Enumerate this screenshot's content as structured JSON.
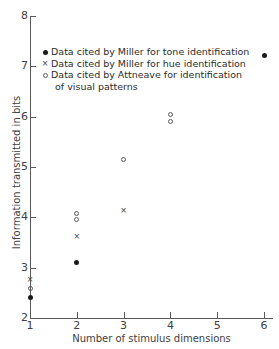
{
  "chart_data": {
    "type": "scatter",
    "title": "",
    "xlabel": "Number of stimulus dimensions",
    "ylabel": "Information transmitted in bits",
    "xlim": [
      1,
      6
    ],
    "ylim": [
      2,
      8
    ],
    "xticks": [
      1,
      2,
      3,
      4,
      5,
      6
    ],
    "yticks": [
      2,
      3,
      4,
      5,
      6,
      7,
      8
    ],
    "xtick_labels": [
      "1",
      "2",
      "3",
      "4",
      "5",
      "6"
    ],
    "ytick_labels": [
      "2",
      "3",
      "4",
      "5",
      "6",
      "7",
      "8"
    ],
    "grid": false,
    "legend_position": "upper-left-inside",
    "series": [
      {
        "name": "Data cited by Miller for tone identification",
        "marker": "filled-circle",
        "color": "#1a1a1a",
        "points": [
          {
            "x": 1,
            "y": 2.4
          },
          {
            "x": 2,
            "y": 3.11
          },
          {
            "x": 6,
            "y": 7.22
          }
        ]
      },
      {
        "name": "Data cited by Miller for hue identification",
        "marker": "cross",
        "color": "#3a3a3c",
        "points": [
          {
            "x": 1,
            "y": 2.76
          },
          {
            "x": 2,
            "y": 3.62
          },
          {
            "x": 3,
            "y": 4.13
          }
        ]
      },
      {
        "name": "Data cited by Attneave for identification of visual patterns",
        "marker": "open-circle",
        "color": "#5c5c5e",
        "points": [
          {
            "x": 1,
            "y": 2.58
          },
          {
            "x": 2,
            "y": 4.07
          },
          {
            "x": 2,
            "y": 3.96
          },
          {
            "x": 3,
            "y": 5.14
          },
          {
            "x": 4,
            "y": 6.05
          },
          {
            "x": 4,
            "y": 5.9
          }
        ]
      }
    ]
  },
  "legend": {
    "entries": [
      {
        "marker": "filled-circle",
        "line1": "Data cited by Miller for tone identification",
        "line2": ""
      },
      {
        "marker": "cross",
        "line1": "Data cited by Miller for hue identification",
        "line2": ""
      },
      {
        "marker": "open-circle",
        "line1": "Data cited by Attneave for identification",
        "line2": "of visual patterns"
      }
    ]
  },
  "colors": {
    "axis": "#58585a",
    "text": "#414042",
    "background": "#ffffff"
  }
}
